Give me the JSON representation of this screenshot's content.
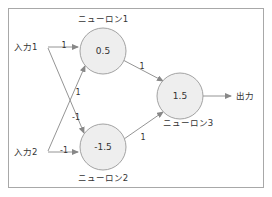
{
  "diagram": {
    "border_color": "#a8a8a8",
    "node_fill": "#eeeeee",
    "node_stroke": "#999999",
    "edge_color": "#888888",
    "text_color": "#333333",
    "inputs": [
      {
        "id": "input1",
        "label": "入力1",
        "x": 30,
        "y": 47
      },
      {
        "id": "input2",
        "label": "入力2",
        "x": 30,
        "y": 152
      }
    ],
    "neurons": [
      {
        "id": "neuron1",
        "caption": "ニューロン1",
        "value": "0.5",
        "cx": 103,
        "cy": 51,
        "r": 23,
        "caption_x": 103,
        "caption_y": 22
      },
      {
        "id": "neuron2",
        "caption": "ニューロン2",
        "value": "-1.5",
        "cx": 103,
        "cy": 147,
        "r": 23,
        "caption_x": 103,
        "caption_y": 181
      },
      {
        "id": "neuron3",
        "caption": "ニューロン3",
        "value": "1.5",
        "cx": 180,
        "cy": 96,
        "r": 23,
        "caption_x": 188,
        "caption_y": 126
      }
    ],
    "output": {
      "id": "output",
      "label": "出力",
      "x": 236,
      "y": 99
    },
    "weights": [
      {
        "id": "w-in1-n1",
        "label": "1",
        "x": 64,
        "y": 45,
        "from": "入力1",
        "to": "ニューロン1"
      },
      {
        "id": "w-in2-n1",
        "label": "1",
        "x": 78,
        "y": 92,
        "from": "入力2",
        "to": "ニューロン1"
      },
      {
        "id": "w-in1-n2",
        "label": "-1",
        "x": 76,
        "y": 117,
        "from": "入力1",
        "to": "ニューロン2"
      },
      {
        "id": "w-in2-n2",
        "label": "-1",
        "x": 64,
        "y": 150,
        "from": "入力2",
        "to": "ニューロン2"
      },
      {
        "id": "w-n1-n3",
        "label": "1",
        "x": 142,
        "y": 66,
        "from": "ニューロン1",
        "to": "ニューロン3"
      },
      {
        "id": "w-n2-n3",
        "label": "1",
        "x": 143,
        "y": 137,
        "from": "ニューロン2",
        "to": "ニューロン3"
      }
    ]
  }
}
